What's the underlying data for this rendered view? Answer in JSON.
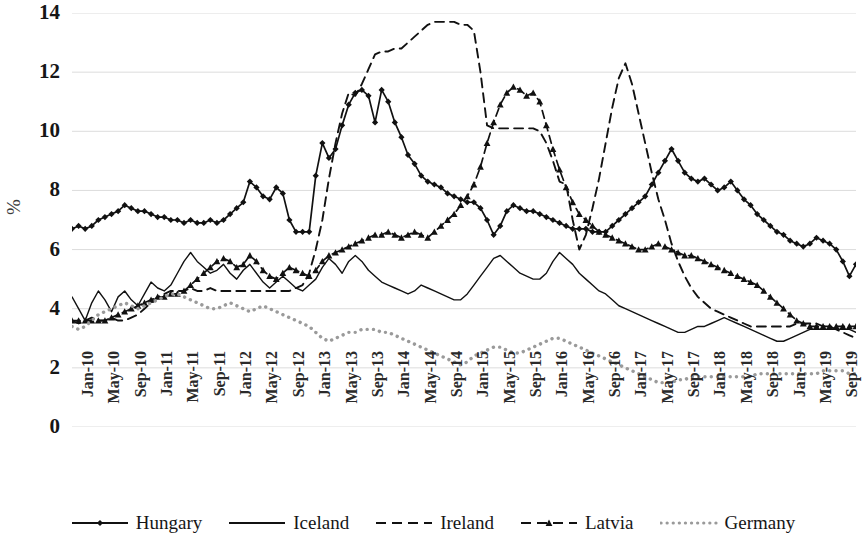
{
  "chart_data": {
    "type": "line",
    "title": "",
    "xlabel": "",
    "ylabel": "%",
    "ylim": [
      0,
      14
    ],
    "ytick_values": [
      0,
      2,
      4,
      6,
      8,
      10,
      12,
      14
    ],
    "grid": true,
    "legend_position": "bottom",
    "x_tick_labels": [
      "Jan-10",
      "May-10",
      "Sep-10",
      "Jan-11",
      "May-11",
      "Sep-11",
      "Jan-12",
      "May-12",
      "Sep-12",
      "Jan-13",
      "May-13",
      "Sep-13",
      "Jan-14",
      "May-14",
      "Sep-14",
      "Jan-15",
      "May-15",
      "Sep-15",
      "Jan-16",
      "May-16",
      "Sep-16",
      "Jan-17",
      "May-17",
      "Sep-17",
      "Jan-18",
      "May-18",
      "Sep-18",
      "Jan-19",
      "May-19",
      "Sep-19"
    ],
    "x_tick_index": [
      0,
      4,
      8,
      12,
      16,
      20,
      24,
      28,
      32,
      36,
      40,
      44,
      48,
      52,
      56,
      60,
      64,
      68,
      72,
      76,
      80,
      84,
      88,
      92,
      96,
      100,
      104,
      108,
      112,
      116
    ],
    "x_count": 120,
    "series": [
      {
        "name": "Hungary",
        "style": "solid-marker",
        "marker": "diamond",
        "color": "#111111",
        "values": [
          6.7,
          6.8,
          6.7,
          6.8,
          7.0,
          7.1,
          7.2,
          7.3,
          7.5,
          7.4,
          7.3,
          7.3,
          7.2,
          7.1,
          7.1,
          7.0,
          7.0,
          6.9,
          7.0,
          6.9,
          6.9,
          7.0,
          6.9,
          7.0,
          7.2,
          7.4,
          7.6,
          8.3,
          8.1,
          7.8,
          7.7,
          8.1,
          7.9,
          7.0,
          6.6,
          6.6,
          6.6,
          8.5,
          9.6,
          9.1,
          9.4,
          10.2,
          10.9,
          11.3,
          11.4,
          11.2,
          10.3,
          11.4,
          11.0,
          10.3,
          9.8,
          9.2,
          8.9,
          8.5,
          8.3,
          8.2,
          8.1,
          7.9,
          7.8,
          7.7,
          7.6,
          7.6,
          7.4,
          7.0,
          6.5,
          6.8,
          7.3,
          7.5,
          7.4,
          7.3,
          7.3,
          7.2,
          7.1,
          7.0,
          6.9,
          6.8,
          6.7,
          6.7,
          6.7,
          6.6,
          6.6,
          6.6,
          6.8,
          7.0,
          7.2,
          7.4,
          7.6,
          7.8,
          8.2,
          8.6,
          9.0,
          9.4,
          9.0,
          8.6,
          8.4,
          8.3,
          8.4,
          8.2,
          8.0,
          8.1,
          8.3,
          8.0,
          7.7,
          7.5,
          7.2,
          7.0,
          6.8,
          6.6,
          6.5,
          6.3,
          6.2,
          6.1,
          6.2,
          6.4,
          6.3,
          6.2,
          6.0,
          5.6,
          5.1,
          5.5,
          6.0,
          6.3,
          6.2,
          6.1,
          6.0,
          5.9,
          5.7,
          5.5,
          5.2,
          4.9,
          4.6,
          4.3,
          4.6,
          5.0,
          4.8,
          4.5,
          4.3,
          4.1,
          3.9,
          3.7,
          3.5,
          3.4,
          3.3,
          3.3,
          3.3,
          3.2,
          3.1,
          3.0,
          3.1,
          3.3,
          3.6,
          3.5,
          3.4,
          3.3,
          3.3,
          3.3
        ]
      },
      {
        "name": "Iceland",
        "style": "solid-thin",
        "marker": "none",
        "color": "#111111",
        "values": [
          4.4,
          4.0,
          3.6,
          4.2,
          4.6,
          4.3,
          3.9,
          4.4,
          4.6,
          4.3,
          4.1,
          4.5,
          4.9,
          4.7,
          4.6,
          4.8,
          5.2,
          5.6,
          5.9,
          5.6,
          5.4,
          5.2,
          5.3,
          5.5,
          5.2,
          5.0,
          5.3,
          5.5,
          5.2,
          4.9,
          4.7,
          4.9,
          5.1,
          4.9,
          4.7,
          4.6,
          4.8,
          5.0,
          5.4,
          5.7,
          5.5,
          5.2,
          5.6,
          5.8,
          5.6,
          5.3,
          5.1,
          4.9,
          4.8,
          4.7,
          4.6,
          4.5,
          4.6,
          4.8,
          4.7,
          4.6,
          4.5,
          4.4,
          4.3,
          4.3,
          4.5,
          4.8,
          5.1,
          5.4,
          5.7,
          5.8,
          5.6,
          5.4,
          5.2,
          5.1,
          5.0,
          5.0,
          5.2,
          5.6,
          5.9,
          5.7,
          5.5,
          5.2,
          5.0,
          4.8,
          4.6,
          4.5,
          4.3,
          4.1,
          4.0,
          3.9,
          3.8,
          3.7,
          3.6,
          3.5,
          3.4,
          3.3,
          3.2,
          3.2,
          3.3,
          3.4,
          3.4,
          3.5,
          3.6,
          3.7,
          3.6,
          3.5,
          3.4,
          3.3,
          3.2,
          3.1,
          3.0,
          2.9,
          2.9,
          3.0,
          3.1,
          3.2,
          3.3,
          3.3,
          3.3,
          3.3,
          3.3,
          3.3,
          3.3,
          3.2,
          3.2,
          3.2,
          3.1,
          3.0,
          3.0,
          3.1,
          3.2,
          3.3,
          3.3,
          3.3,
          3.3,
          3.3,
          3.2,
          3.1,
          3.0,
          2.9,
          2.7,
          2.4,
          2.1,
          1.8,
          1.4,
          1.0,
          0.7,
          0.6,
          0.9,
          1.2,
          1.3,
          1.2,
          1.1,
          1.1,
          1.0,
          1.1,
          1.1,
          1.0,
          1.0,
          1.0
        ]
      },
      {
        "name": "Ireland",
        "style": "dashed",
        "marker": "none",
        "color": "#111111",
        "values": [
          3.6,
          3.5,
          3.6,
          3.7,
          3.6,
          3.6,
          3.7,
          3.6,
          3.6,
          3.7,
          3.8,
          4.0,
          4.2,
          4.4,
          4.5,
          4.6,
          4.6,
          4.6,
          4.7,
          4.6,
          4.6,
          4.7,
          4.6,
          4.6,
          4.6,
          4.6,
          4.6,
          4.6,
          4.6,
          4.6,
          4.6,
          4.6,
          4.6,
          4.6,
          4.7,
          4.8,
          5.2,
          6.0,
          7.0,
          8.4,
          9.6,
          10.6,
          11.3,
          11.2,
          11.6,
          12.1,
          12.6,
          12.7,
          12.7,
          12.8,
          12.8,
          13.0,
          13.2,
          13.4,
          13.6,
          13.7,
          13.7,
          13.7,
          13.7,
          13.6,
          13.6,
          13.4,
          12.0,
          10.2,
          10.1,
          10.1,
          10.1,
          10.1,
          10.1,
          10.1,
          10.1,
          10.0,
          9.6,
          9.0,
          8.3,
          8.2,
          7.0,
          6.0,
          6.5,
          7.4,
          8.4,
          9.6,
          10.8,
          11.8,
          12.3,
          11.6,
          10.6,
          9.6,
          8.6,
          7.7,
          7.0,
          6.2,
          5.6,
          5.1,
          4.7,
          4.4,
          4.2,
          4.0,
          3.9,
          3.8,
          3.7,
          3.6,
          3.5,
          3.4,
          3.4,
          3.4,
          3.4,
          3.4,
          3.4,
          3.4,
          3.5,
          3.5,
          3.5,
          3.5,
          3.4,
          3.4,
          3.3,
          3.2,
          3.1,
          3.0,
          3.0,
          3.0,
          3.0,
          3.0,
          3.0,
          3.0,
          3.0,
          2.9,
          2.9,
          2.8,
          2.8,
          2.7,
          2.7,
          2.7,
          2.6,
          2.6,
          2.6,
          2.6,
          2.6,
          2.6,
          2.6,
          2.6,
          2.6,
          2.6,
          2.6,
          2.6,
          2.6,
          2.6,
          2.6,
          2.6,
          2.6,
          2.6,
          2.6,
          2.6,
          2.6,
          2.6
        ]
      },
      {
        "name": "Latvia",
        "style": "dashed-marker",
        "marker": "triangle",
        "color": "#111111",
        "values": [
          3.6,
          3.6,
          3.6,
          3.6,
          3.6,
          3.6,
          3.7,
          3.8,
          3.9,
          4.0,
          4.1,
          4.2,
          4.3,
          4.4,
          4.4,
          4.5,
          4.5,
          4.6,
          4.8,
          5.0,
          5.2,
          5.4,
          5.6,
          5.7,
          5.6,
          5.4,
          5.5,
          5.8,
          5.6,
          5.3,
          5.1,
          5.0,
          5.2,
          5.4,
          5.3,
          5.2,
          5.1,
          5.3,
          5.6,
          5.8,
          5.9,
          6.0,
          6.1,
          6.2,
          6.3,
          6.4,
          6.5,
          6.5,
          6.6,
          6.5,
          6.4,
          6.5,
          6.6,
          6.5,
          6.4,
          6.6,
          6.8,
          7.0,
          7.2,
          7.5,
          7.8,
          8.2,
          8.8,
          9.6,
          10.3,
          10.9,
          11.3,
          11.5,
          11.4,
          11.2,
          11.3,
          11.0,
          10.2,
          9.4,
          8.7,
          8.1,
          7.6,
          7.2,
          7.0,
          6.8,
          6.6,
          6.5,
          6.4,
          6.3,
          6.2,
          6.1,
          6.0,
          6.0,
          6.1,
          6.2,
          6.1,
          6.0,
          5.9,
          5.8,
          5.8,
          5.7,
          5.6,
          5.5,
          5.4,
          5.3,
          5.2,
          5.1,
          5.0,
          4.9,
          4.8,
          4.6,
          4.4,
          4.2,
          4.0,
          3.8,
          3.6,
          3.5,
          3.4,
          3.4,
          3.4,
          3.4,
          3.4,
          3.4,
          3.4,
          3.4,
          3.4,
          3.4,
          3.4,
          3.4,
          3.4,
          3.5,
          3.6,
          3.7,
          3.6,
          3.5,
          3.4,
          3.3,
          3.2,
          3.0,
          2.8,
          2.6,
          2.4,
          2.2,
          2.0,
          1.7,
          1.4,
          1.1,
          0.8,
          0.5,
          0.4,
          0.3,
          0.6,
          1.1,
          1.2,
          1.1,
          1.0,
          1.0,
          1.1,
          1.1,
          1.0,
          1.0
        ]
      },
      {
        "name": "Germany",
        "style": "dotted",
        "marker": "none",
        "color": "#9a9a9a",
        "values": [
          3.4,
          3.3,
          3.4,
          3.6,
          3.8,
          3.9,
          4.0,
          4.1,
          4.2,
          4.1,
          4.0,
          4.1,
          4.2,
          4.3,
          4.4,
          4.5,
          4.5,
          4.4,
          4.3,
          4.2,
          4.1,
          4.0,
          4.0,
          4.1,
          4.2,
          4.1,
          4.0,
          3.9,
          4.0,
          4.1,
          4.0,
          3.9,
          3.8,
          3.7,
          3.6,
          3.5,
          3.4,
          3.2,
          3.0,
          2.9,
          3.0,
          3.1,
          3.2,
          3.2,
          3.3,
          3.3,
          3.3,
          3.2,
          3.2,
          3.1,
          3.0,
          2.9,
          2.8,
          2.7,
          2.6,
          2.5,
          2.4,
          2.3,
          2.2,
          2.1,
          2.2,
          2.4,
          2.5,
          2.6,
          2.7,
          2.7,
          2.6,
          2.5,
          2.5,
          2.6,
          2.7,
          2.8,
          2.9,
          3.0,
          3.0,
          2.9,
          2.8,
          2.7,
          2.6,
          2.5,
          2.4,
          2.3,
          2.2,
          2.1,
          2.0,
          1.9,
          1.8,
          1.7,
          1.6,
          1.5,
          1.5,
          1.5,
          1.6,
          1.6,
          1.7,
          1.7,
          1.7,
          1.7,
          1.7,
          1.7,
          1.7,
          1.7,
          1.7,
          1.7,
          1.8,
          1.8,
          1.8,
          1.8,
          1.8,
          1.8,
          1.8,
          1.8,
          1.8,
          1.8,
          1.9,
          1.9,
          1.9,
          1.9,
          1.8,
          1.8,
          1.8,
          1.8,
          1.9,
          2.0,
          2.0,
          1.9,
          1.8,
          1.7,
          1.6,
          1.5,
          1.4,
          1.3,
          1.2,
          1.1,
          1.0,
          0.9,
          0.8,
          0.7,
          0.6,
          0.5,
          0.4,
          0.3,
          0.4,
          0.6,
          0.8,
          0.9,
          0.8,
          0.7,
          0.6,
          0.6,
          0.6,
          0.5,
          0.5,
          0.5,
          0.5,
          0.5
        ]
      }
    ]
  },
  "legend": {
    "items": [
      {
        "label": "Hungary"
      },
      {
        "label": "Iceland"
      },
      {
        "label": "Ireland"
      },
      {
        "label": "Latvia"
      },
      {
        "label": "Germany"
      }
    ]
  }
}
